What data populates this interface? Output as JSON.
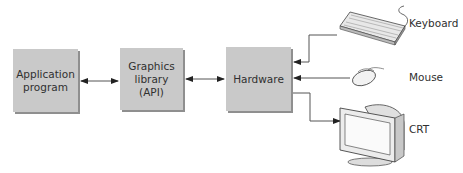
{
  "diagram": {
    "boxes": [
      {
        "id": "application",
        "lines": [
          "Application",
          "program"
        ]
      },
      {
        "id": "graphics",
        "lines": [
          "Graphics",
          "library",
          "(API)"
        ]
      },
      {
        "id": "hardware",
        "lines": [
          "Hardware"
        ]
      }
    ],
    "devices": [
      {
        "id": "keyboard",
        "label": "Keyboard",
        "icon": "keyboard-icon"
      },
      {
        "id": "mouse",
        "label": "Mouse",
        "icon": "mouse-icon"
      },
      {
        "id": "crt",
        "label": "CRT",
        "icon": "crt-monitor-icon"
      }
    ],
    "connections": [
      {
        "from": "application",
        "to": "graphics",
        "direction": "bidirectional"
      },
      {
        "from": "graphics",
        "to": "hardware",
        "direction": "bidirectional"
      },
      {
        "from": "keyboard",
        "to": "hardware",
        "direction": "one-way"
      },
      {
        "from": "mouse",
        "to": "hardware",
        "direction": "one-way"
      },
      {
        "from": "hardware",
        "to": "crt",
        "direction": "one-way"
      }
    ],
    "colors": {
      "box_fill": "#c9c9c9",
      "box_shadow": "#8f8f8f",
      "line": "#555555"
    }
  }
}
